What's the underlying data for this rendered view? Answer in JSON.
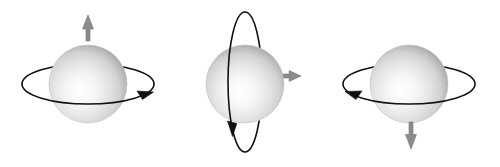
{
  "figure": {
    "background_color": "#ffffff",
    "width": 500,
    "height": 167,
    "ring_color": "#111111",
    "ring_stroke_width": 1.6,
    "arrow_color": "#8b8b8b",
    "arrow_outline_color": "#757575",
    "sphere_highlight_color": "#ffffff",
    "sphere_mid_color": "#dcdcdc",
    "sphere_edge_color": "#9a9a9a",
    "panels": [
      {
        "id": "panel-up",
        "label": "spin up",
        "sphere": {
          "cx": 88,
          "cy": 84,
          "r": 39
        },
        "ring": {
          "orientation": "horizontal",
          "cx": 88,
          "cy": 84,
          "rx": 66,
          "ry": 20,
          "rotation_sense": "counterclockwise-from-above",
          "arrowhead_side": "right",
          "arrowhead_direction": "right"
        },
        "momentum_arrow": {
          "direction": "up",
          "x": 88,
          "y_tail": 41,
          "y_tip": 15,
          "length": 26,
          "shaft_width": 4,
          "head_width": 11
        }
      },
      {
        "id": "panel-right",
        "label": "spin right",
        "sphere": {
          "cx": 245,
          "cy": 84,
          "r": 39
        },
        "ring": {
          "orientation": "vertical",
          "cx": 245,
          "cy": 82,
          "rx": 17,
          "ry": 70,
          "rotation_sense": "front-face-downward-on-left",
          "arrowhead_side": "bottom-left",
          "arrowhead_direction": "down"
        },
        "momentum_arrow": {
          "direction": "right",
          "y": 76,
          "x_tail": 283,
          "x_tip": 301,
          "length": 18,
          "shaft_width": 4,
          "head_width": 11
        }
      },
      {
        "id": "panel-down",
        "label": "spin down",
        "sphere": {
          "cx": 409,
          "cy": 84,
          "r": 39
        },
        "ring": {
          "orientation": "horizontal",
          "cx": 409,
          "cy": 84,
          "rx": 66,
          "ry": 20,
          "rotation_sense": "clockwise-from-above",
          "arrowhead_side": "left",
          "arrowhead_direction": "left"
        },
        "momentum_arrow": {
          "direction": "down",
          "x": 411,
          "y_tail": 122,
          "y_tip": 149,
          "length": 27,
          "shaft_width": 4,
          "head_width": 11
        }
      }
    ]
  }
}
